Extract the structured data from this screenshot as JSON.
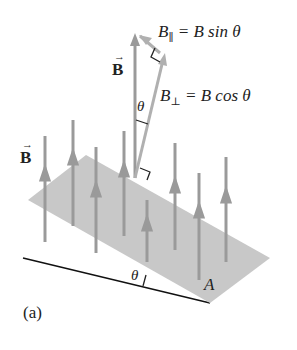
{
  "diagram": {
    "panel_label": "(a)",
    "field_label": "B",
    "field_label_top": "B",
    "parallel_component": {
      "symbol": "B",
      "subscript": "∥",
      "equation": "= B sin θ"
    },
    "perpendicular_component": {
      "symbol": "B",
      "subscript": "⊥",
      "equation": "= B cos θ"
    },
    "angle_label_top": "θ",
    "angle_label_bottom": "θ",
    "area_label": "A",
    "colors": {
      "field_line": "#9a9a9a",
      "plane": "#c8c8c8",
      "text": "#222222",
      "baseline": "#111111"
    }
  }
}
